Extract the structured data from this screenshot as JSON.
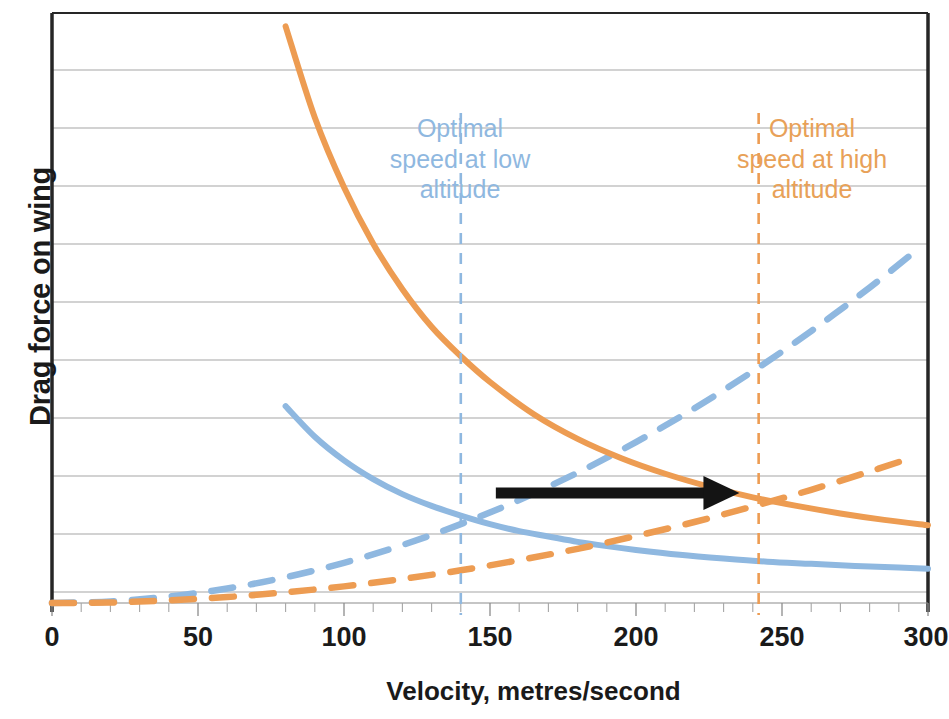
{
  "chart": {
    "title": "",
    "xlabel": "Velocity, metres/second",
    "ylabel": "Drag force on wing",
    "annotation_low": "Optimal\nspeed at low\naltitude",
    "annotation_high": "Optimal\nspeed at high\naltitude",
    "tick_0": "0",
    "tick_50": "50",
    "tick_100": "100",
    "tick_150": "150",
    "tick_200": "200",
    "tick_250": "250",
    "tick_300": "300"
  },
  "chart_data": {
    "type": "line",
    "title": "",
    "xlabel": "Velocity, metres/second",
    "ylabel": "Drag force on wing",
    "xlim": [
      0,
      300
    ],
    "ylim": [
      0,
      11
    ],
    "xticks": [
      0,
      50,
      100,
      150,
      200,
      250,
      300
    ],
    "xtick_labels": [
      "0",
      "50",
      "100",
      "150",
      "200",
      "250",
      "300"
    ],
    "yticks": [
      0,
      1,
      2,
      3,
      4,
      5,
      6,
      7,
      8,
      9,
      10,
      11
    ],
    "ytick_labels": [],
    "grid": "horizontal",
    "legend": "none",
    "colors": {
      "low_altitude": "#8FB8E0",
      "high_altitude": "#ED9C52",
      "arrow": "#141414",
      "gridline": "#A6A6A6",
      "axis": "#262626"
    },
    "series": [
      {
        "name": "Induced drag, low altitude",
        "color": "#8FB8E0",
        "style": "solid",
        "x": [
          80,
          90,
          100,
          110,
          120,
          130,
          140,
          150,
          160,
          170,
          180,
          190,
          200,
          215,
          230,
          245,
          260,
          275,
          290,
          300
        ],
        "y": [
          3.67,
          3.1,
          2.66,
          2.31,
          2.03,
          1.81,
          1.63,
          1.47,
          1.34,
          1.24,
          1.14,
          1.06,
          0.99,
          0.9,
          0.83,
          0.77,
          0.73,
          0.69,
          0.66,
          0.64
        ]
      },
      {
        "name": "Parasitic drag, low altitude",
        "color": "#8FB8E0",
        "style": "dashed",
        "x": [
          0,
          20,
          40,
          60,
          80,
          100,
          120,
          140,
          160,
          180,
          200,
          220,
          240,
          260,
          280,
          295
        ],
        "y": [
          0.0,
          0.03,
          0.12,
          0.27,
          0.48,
          0.75,
          1.08,
          1.47,
          1.92,
          2.43,
          3.0,
          3.63,
          4.32,
          5.07,
          5.88,
          6.53
        ]
      },
      {
        "name": "Induced drag, high altitude",
        "color": "#ED9C52",
        "style": "solid",
        "x": [
          80,
          90,
          100,
          110,
          120,
          130,
          140,
          150,
          165,
          180,
          195,
          210,
          225,
          240,
          255,
          270,
          285,
          300
        ],
        "y": [
          10.75,
          9.05,
          7.75,
          6.7,
          5.85,
          5.15,
          4.6,
          4.12,
          3.52,
          3.06,
          2.7,
          2.41,
          2.17,
          1.97,
          1.81,
          1.67,
          1.55,
          1.45
        ]
      },
      {
        "name": "Parasitic drag, high altitude",
        "color": "#ED9C52",
        "style": "dashed",
        "x": [
          0,
          20,
          40,
          60,
          80,
          100,
          120,
          140,
          160,
          180,
          200,
          220,
          240,
          260,
          280,
          295
        ],
        "y": [
          0.0,
          0.01,
          0.05,
          0.11,
          0.2,
          0.31,
          0.45,
          0.61,
          0.8,
          1.01,
          1.25,
          1.51,
          1.8,
          2.11,
          2.45,
          2.72
        ]
      }
    ],
    "markers": [
      {
        "name": "optimal-speed-low-altitude",
        "type": "vline",
        "x": 140,
        "color": "#8FB8E0",
        "style": "dashed",
        "label": "Optimal speed at low altitude"
      },
      {
        "name": "optimal-speed-high-altitude",
        "type": "vline",
        "x": 242,
        "color": "#ED9C52",
        "style": "dashed",
        "label": "Optimal speed at high altitude"
      },
      {
        "name": "shift-arrow",
        "type": "arrow",
        "x_start": 152,
        "x_end": 232,
        "y": 2.05,
        "color": "#141414",
        "direction": "right"
      }
    ]
  }
}
